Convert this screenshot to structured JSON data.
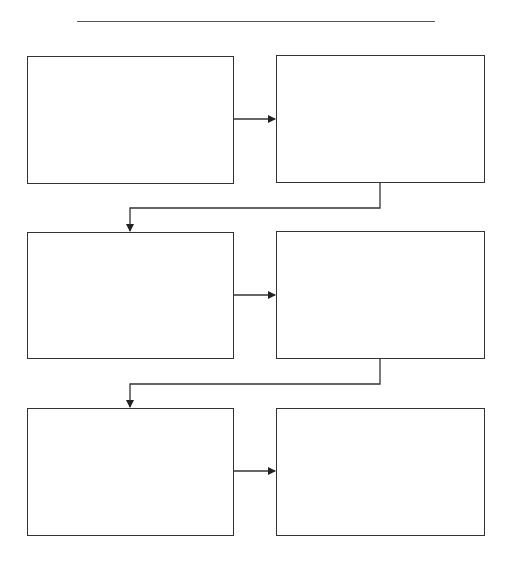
{
  "diagram": {
    "type": "sequence-flow-chart",
    "title": "",
    "title_line": {
      "x1": 77,
      "x2": 435,
      "y": 21
    },
    "stroke_color": "#333333",
    "boxes": [
      {
        "id": "box-1",
        "text": "",
        "x": 27,
        "y": 56,
        "w": 206,
        "h": 127
      },
      {
        "id": "box-2",
        "text": "",
        "x": 276,
        "y": 55,
        "w": 208,
        "h": 127
      },
      {
        "id": "box-3",
        "text": "",
        "x": 27,
        "y": 232,
        "w": 206,
        "h": 126
      },
      {
        "id": "box-4",
        "text": "",
        "x": 276,
        "y": 231,
        "w": 208,
        "h": 127
      },
      {
        "id": "box-5",
        "text": "",
        "x": 27,
        "y": 408,
        "w": 206,
        "h": 127
      },
      {
        "id": "box-6",
        "text": "",
        "x": 276,
        "y": 408,
        "w": 208,
        "h": 127
      }
    ],
    "connectors": [
      {
        "from": "box-1",
        "to": "box-2",
        "points": [
          [
            233,
            119
          ],
          [
            276,
            119
          ]
        ]
      },
      {
        "from": "box-2",
        "to": "box-3",
        "points": [
          [
            380,
            182
          ],
          [
            380,
            208
          ],
          [
            130,
            208
          ],
          [
            130,
            232
          ]
        ]
      },
      {
        "from": "box-3",
        "to": "box-4",
        "points": [
          [
            233,
            295
          ],
          [
            276,
            295
          ]
        ]
      },
      {
        "from": "box-4",
        "to": "box-5",
        "points": [
          [
            380,
            358
          ],
          [
            380,
            384
          ],
          [
            130,
            384
          ],
          [
            130,
            408
          ]
        ]
      },
      {
        "from": "box-5",
        "to": "box-6",
        "points": [
          [
            233,
            471
          ],
          [
            276,
            471
          ]
        ]
      }
    ]
  }
}
